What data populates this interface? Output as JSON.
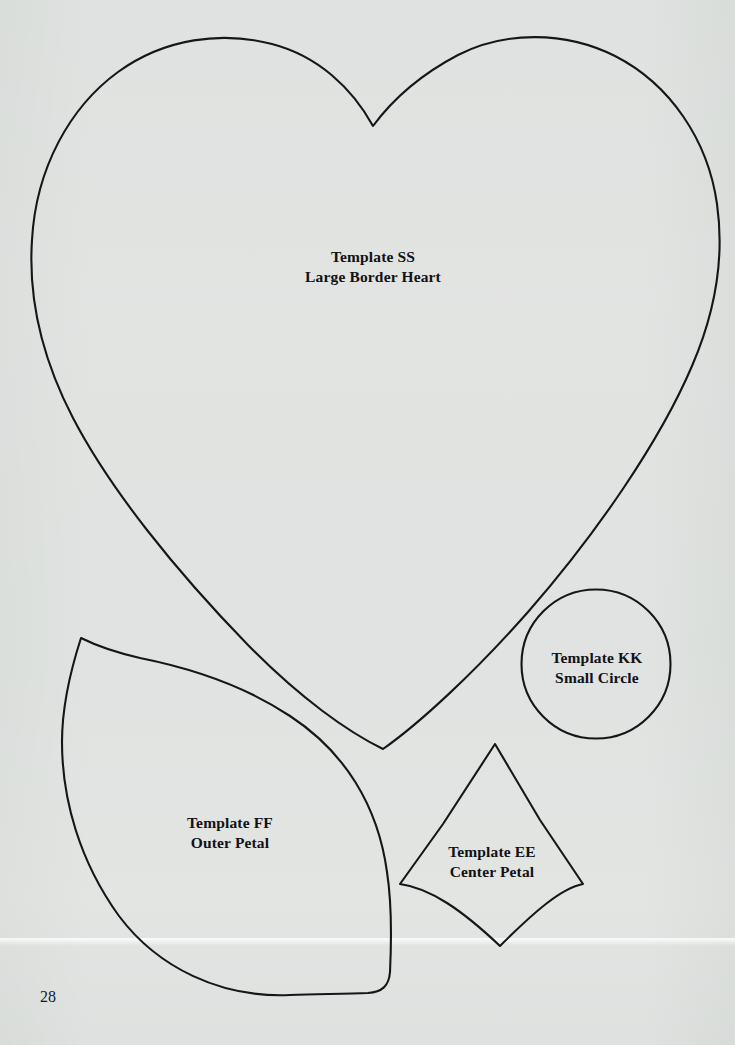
{
  "page": {
    "number": "28",
    "paper_color": "#eef0ef",
    "ink_color": "#15161a",
    "width": 735,
    "height": 1045
  },
  "templates": [
    {
      "id": "ss",
      "shape": "heart",
      "code": "Template SS",
      "name": "Large Border Heart",
      "label_x": 373,
      "label_y": 267
    },
    {
      "id": "kk",
      "shape": "circle",
      "code": "Template KK",
      "name": "Small Circle",
      "label_x": 597,
      "label_y": 668
    },
    {
      "id": "ff",
      "shape": "leaf-petal",
      "code": "Template FF",
      "name": "Outer Petal",
      "label_x": 230,
      "label_y": 833
    },
    {
      "id": "ee",
      "shape": "diamond-petal",
      "code": "Template EE",
      "name": "Center Petal",
      "label_x": 492,
      "label_y": 862
    }
  ]
}
